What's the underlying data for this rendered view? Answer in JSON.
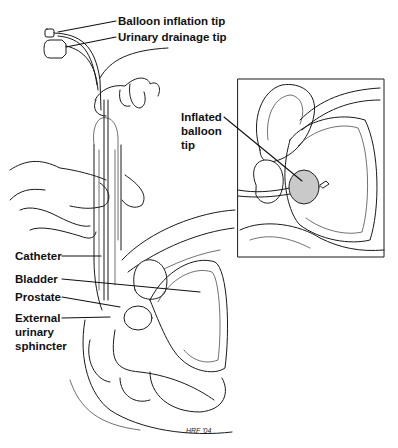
{
  "figure": {
    "labels": {
      "balloon_inflation_tip": "Balloon inflation tip",
      "urinary_drainage_tip": "Urinary drainage tip",
      "inflated_balloon_tip_line1": "Inflated",
      "inflated_balloon_tip_line2": "balloon",
      "inflated_balloon_tip_line3": "tip",
      "catheter": "Catheter",
      "bladder": "Bladder",
      "prostate": "Prostate",
      "external_sphincter_line1": "External",
      "external_sphincter_line2": "urinary",
      "external_sphincter_line3": "sphincter"
    },
    "signature": "HRF '04",
    "colors": {
      "line": "#1a1a1a",
      "balloon_fill": "#c9c9c9",
      "background": "#ffffff"
    }
  }
}
